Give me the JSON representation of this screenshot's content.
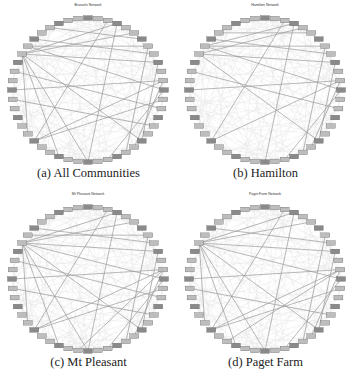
{
  "figure": {
    "panels": [
      {
        "id": "a",
        "caption": "(a) All Communities",
        "title": "Brussels Network",
        "cx": 88,
        "cy": 82,
        "rx": 76,
        "ry": 72,
        "edges": [
          [
            11,
            19
          ],
          [
            11,
            30
          ],
          [
            11,
            36
          ],
          [
            40,
            5
          ],
          [
            40,
            3
          ],
          [
            40,
            9
          ],
          [
            40,
            18
          ],
          [
            40,
            24
          ],
          [
            40,
            27
          ],
          [
            40,
            31
          ],
          [
            41,
            7
          ],
          [
            41,
            12
          ],
          [
            42,
            8
          ],
          [
            2,
            30
          ],
          [
            3,
            24
          ],
          [
            6,
            44
          ],
          [
            7,
            20
          ],
          [
            9,
            18
          ],
          [
            12,
            22
          ],
          [
            13,
            30
          ],
          [
            14,
            38
          ],
          [
            16,
            35
          ]
        ]
      },
      {
        "id": "b",
        "caption": "(b) Hamilton",
        "title": "Hamilton Network",
        "cx": 88,
        "cy": 82,
        "rx": 76,
        "ry": 72,
        "edges": [
          [
            11,
            19
          ],
          [
            11,
            30
          ],
          [
            11,
            36
          ],
          [
            40,
            4
          ],
          [
            40,
            9
          ],
          [
            40,
            18
          ],
          [
            41,
            3
          ],
          [
            41,
            7
          ],
          [
            41,
            12
          ],
          [
            42,
            8
          ],
          [
            2,
            30
          ],
          [
            3,
            24
          ],
          [
            7,
            20
          ],
          [
            9,
            18
          ],
          [
            12,
            22
          ],
          [
            14,
            38
          ],
          [
            43,
            5
          ]
        ]
      },
      {
        "id": "c",
        "caption": "(c) Mt Pleasant",
        "title": "Mt Pleasant Network",
        "cx": 88,
        "cy": 82,
        "rx": 76,
        "ry": 72,
        "edges": [
          [
            11,
            19
          ],
          [
            11,
            30
          ],
          [
            11,
            36
          ],
          [
            40,
            5
          ],
          [
            40,
            3
          ],
          [
            40,
            9
          ],
          [
            40,
            18
          ],
          [
            40,
            24
          ],
          [
            40,
            27
          ],
          [
            40,
            31
          ],
          [
            40,
            12
          ],
          [
            41,
            7
          ],
          [
            42,
            8
          ],
          [
            2,
            30
          ],
          [
            3,
            24
          ],
          [
            7,
            20
          ],
          [
            9,
            18
          ],
          [
            12,
            22
          ],
          [
            13,
            30
          ],
          [
            14,
            38
          ],
          [
            16,
            35
          ],
          [
            11,
            25
          ]
        ]
      },
      {
        "id": "d",
        "caption": "(d) Paget Farm",
        "title": "Paget Farm Network",
        "cx": 88,
        "cy": 82,
        "rx": 76,
        "ry": 72,
        "edges": [
          [
            11,
            19
          ],
          [
            11,
            30
          ],
          [
            11,
            36
          ],
          [
            40,
            5
          ],
          [
            40,
            3
          ],
          [
            40,
            9
          ],
          [
            40,
            18
          ],
          [
            40,
            24
          ],
          [
            40,
            27
          ],
          [
            40,
            31
          ],
          [
            40,
            12
          ],
          [
            42,
            8
          ],
          [
            2,
            30
          ],
          [
            3,
            24
          ],
          [
            7,
            20
          ],
          [
            9,
            18
          ],
          [
            12,
            22
          ],
          [
            13,
            30
          ],
          [
            16,
            35
          ],
          [
            11,
            28
          ]
        ]
      }
    ],
    "node_count": 48,
    "colors": {
      "node_fill": "#8a8a8a",
      "node_stroke": "#555555",
      "edge_strong": "#9a9a9a",
      "edge_faint": "#e2e2e2"
    }
  }
}
